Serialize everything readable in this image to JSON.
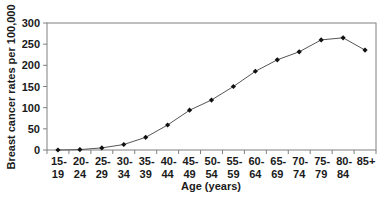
{
  "chart_data": {
    "type": "line",
    "title": "",
    "xlabel": "Age (years)",
    "ylabel": "Breast cancer rates per 100,000",
    "categories": [
      [
        "15-",
        "19"
      ],
      [
        "20-",
        "24"
      ],
      [
        "25-",
        "29"
      ],
      [
        "30-",
        "34"
      ],
      [
        "35-",
        "39"
      ],
      [
        "40-",
        "44"
      ],
      [
        "45-",
        "49"
      ],
      [
        "50-",
        "54"
      ],
      [
        "55-",
        "59"
      ],
      [
        "60-",
        "64"
      ],
      [
        "65-",
        "69"
      ],
      [
        "70-",
        "74"
      ],
      [
        "75-",
        "79"
      ],
      [
        "80-",
        "84"
      ],
      [
        "85+",
        ""
      ]
    ],
    "series": [
      {
        "name": "Breast cancer rate",
        "values": [
          0,
          1,
          5,
          13,
          30,
          59,
          94,
          118,
          150,
          186,
          213,
          232,
          260,
          265,
          236
        ],
        "color": "#555555",
        "marker": "diamond",
        "marker_color": "#111111"
      }
    ],
    "ylim": [
      0,
      300
    ],
    "yticks": [
      0,
      50,
      100,
      150,
      200,
      250,
      300
    ],
    "grid": false,
    "legend": "none"
  }
}
